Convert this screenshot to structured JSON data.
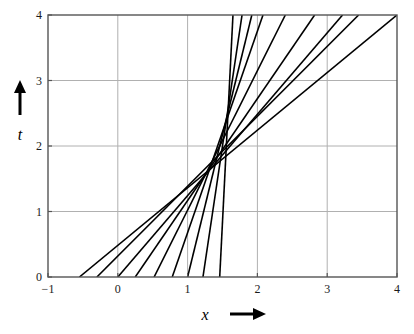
{
  "figure": {
    "title": "",
    "background": "#ffffff",
    "frame_color": "#555555",
    "grid_color": "#b0b0b0",
    "line_color": "#000000"
  },
  "axes": {
    "x_label": "x",
    "x_arrow": "arrow-right",
    "y_label": "t",
    "y_arrow": "arrow-up",
    "x_ticks": [
      "-1",
      "0",
      "1",
      "2",
      "3",
      "4"
    ],
    "y_ticks": [
      "0",
      "1",
      "2",
      "3",
      "4"
    ]
  },
  "chart_data": {
    "type": "line",
    "title": "",
    "xlabel": "x",
    "ylabel": "t",
    "xlim": [
      -1,
      4
    ],
    "ylim": [
      0,
      4
    ],
    "xticks": [
      -1,
      0,
      1,
      2,
      3,
      4
    ],
    "yticks": [
      0,
      1,
      2,
      3,
      4
    ],
    "grid": true,
    "legend": "none",
    "convergence_point": [
      1.6,
      1.4
    ],
    "series": [
      {
        "name": "line-1",
        "x": [
          -0.55,
          4.0
        ],
        "y": [
          0.0,
          4.0
        ],
        "x_at_t0": -0.55,
        "x_at_t4": 4.0,
        "slope": 0.88
      },
      {
        "name": "line-2",
        "x": [
          -0.3,
          3.45
        ],
        "y": [
          0.0,
          4.0
        ],
        "x_at_t0": -0.3,
        "x_at_t4": 3.45,
        "slope": 1.07
      },
      {
        "name": "line-3",
        "x": [
          0.0,
          3.22
        ],
        "y": [
          0.0,
          4.0
        ],
        "x_at_t0": 0.0,
        "x_at_t4": 3.22,
        "slope": 1.24
      },
      {
        "name": "line-4",
        "x": [
          0.25,
          2.82
        ],
        "y": [
          0.0,
          4.0
        ],
        "x_at_t0": 0.25,
        "x_at_t4": 2.82,
        "slope": 1.56
      },
      {
        "name": "line-5",
        "x": [
          0.52,
          2.4
        ],
        "y": [
          0.0,
          4.0
        ],
        "x_at_t0": 0.52,
        "x_at_t4": 2.4,
        "slope": 2.13
      },
      {
        "name": "line-6",
        "x": [
          0.78,
          2.08
        ],
        "y": [
          0.0,
          4.0
        ],
        "x_at_t0": 0.78,
        "x_at_t4": 2.08,
        "slope": 3.08
      },
      {
        "name": "line-7",
        "x": [
          1.0,
          1.92
        ],
        "y": [
          0.0,
          4.0
        ],
        "x_at_t0": 1.0,
        "x_at_t4": 1.92,
        "slope": 4.35
      },
      {
        "name": "line-8",
        "x": [
          1.22,
          1.78
        ],
        "y": [
          0.0,
          4.0
        ],
        "x_at_t0": 1.22,
        "x_at_t4": 1.78,
        "slope": 7.14
      },
      {
        "name": "line-9",
        "x": [
          1.46,
          1.65
        ],
        "y": [
          0.0,
          4.0
        ],
        "x_at_t0": 1.46,
        "x_at_t4": 1.65,
        "slope": 21.05
      }
    ]
  }
}
